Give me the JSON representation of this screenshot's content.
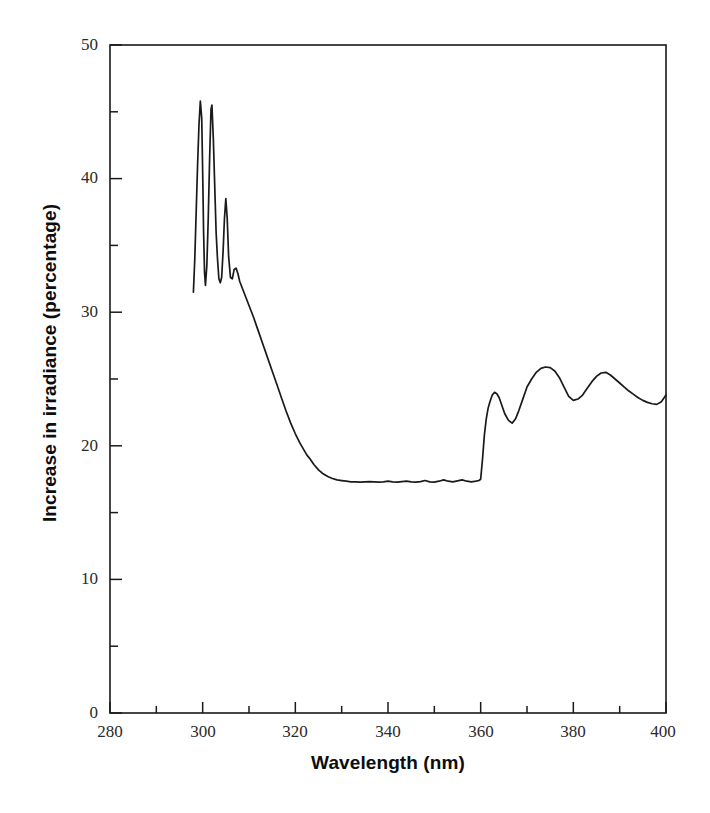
{
  "figure": {
    "background": "#ffffff",
    "line_color": "#1a1a1a",
    "axis_color": "#1a1a1a",
    "text_color": "#0d0d0d"
  },
  "axes": {
    "x_title": "Wavelength (nm)",
    "y_title": "Increase in irradiance (percentage)",
    "x_ticks": [
      "280",
      "300",
      "320",
      "340",
      "360",
      "380",
      "400"
    ],
    "y_ticks": [
      "0",
      "10",
      "20",
      "30",
      "40",
      "50"
    ]
  },
  "chart_data": {
    "type": "line",
    "title": "",
    "xlabel": "Wavelength (nm)",
    "ylabel": "Increase in irradiance (percentage)",
    "xlim": [
      280,
      400
    ],
    "ylim": [
      0,
      50
    ],
    "xticks": [
      280,
      300,
      320,
      340,
      360,
      380,
      400
    ],
    "yticks": [
      0,
      10,
      20,
      30,
      40,
      50
    ],
    "x_minor_tick_interval": 10,
    "y_minor_tick_interval": 5,
    "grid": false,
    "legend": false,
    "frame": "full-box",
    "series": [
      {
        "name": "Increase in irradiance",
        "x": [
          298.0,
          298.3,
          298.6,
          298.9,
          299.2,
          299.5,
          299.8,
          300.0,
          300.2,
          300.4,
          300.6,
          300.9,
          301.2,
          301.5,
          301.8,
          302.0,
          302.3,
          302.6,
          302.9,
          303.2,
          303.5,
          303.8,
          304.1,
          304.4,
          304.7,
          305.0,
          305.3,
          305.6,
          306.0,
          306.4,
          306.8,
          307.2,
          307.6,
          308.0,
          309.0,
          310.0,
          311.0,
          312.0,
          313.0,
          314.0,
          315.0,
          316.0,
          317.0,
          318.0,
          319.0,
          320.0,
          321.0,
          322.0,
          322.5,
          323.0,
          324.0,
          325.0,
          326.0,
          327.0,
          328.0,
          329.0,
          330.0,
          331.0,
          332.0,
          333.0,
          334.0,
          335.0,
          336.0,
          337.0,
          338.0,
          339.0,
          340.0,
          341.0,
          342.0,
          343.0,
          344.0,
          345.0,
          346.0,
          347.0,
          348.0,
          349.0,
          350.0,
          351.0,
          352.0,
          353.0,
          354.0,
          355.0,
          356.0,
          357.0,
          358.0,
          359.0,
          359.6,
          360.0,
          360.4,
          360.8,
          361.2,
          361.6,
          362.0,
          362.5,
          363.0,
          363.5,
          364.0,
          364.6,
          365.2,
          366.0,
          366.8,
          367.5,
          368.2,
          369.0,
          370.0,
          371.0,
          372.0,
          373.0,
          374.0,
          375.0,
          376.0,
          377.0,
          378.0,
          379.0,
          380.0,
          381.0,
          382.0,
          383.0,
          384.0,
          385.0,
          386.0,
          387.0,
          388.0,
          389.0,
          390.0,
          391.0,
          392.0,
          393.0,
          394.0,
          395.0,
          396.0,
          397.0,
          398.0,
          399.0,
          400.0
        ],
        "y": [
          31.5,
          34.0,
          37.5,
          41.0,
          44.0,
          45.8,
          44.5,
          40.5,
          36.0,
          33.0,
          32.0,
          33.5,
          37.0,
          41.5,
          45.2,
          45.5,
          43.0,
          39.5,
          36.0,
          34.0,
          32.5,
          32.2,
          32.6,
          34.5,
          37.0,
          38.5,
          37.0,
          34.2,
          32.6,
          32.5,
          33.2,
          33.3,
          32.9,
          32.3,
          31.4,
          30.5,
          29.6,
          28.6,
          27.6,
          26.6,
          25.6,
          24.6,
          23.6,
          22.6,
          21.7,
          20.9,
          20.2,
          19.6,
          19.3,
          19.1,
          18.6,
          18.2,
          17.9,
          17.7,
          17.55,
          17.45,
          17.4,
          17.35,
          17.3,
          17.3,
          17.28,
          17.3,
          17.32,
          17.3,
          17.28,
          17.3,
          17.35,
          17.3,
          17.28,
          17.32,
          17.35,
          17.3,
          17.28,
          17.32,
          17.4,
          17.3,
          17.28,
          17.35,
          17.45,
          17.35,
          17.3,
          17.38,
          17.45,
          17.35,
          17.3,
          17.35,
          17.4,
          17.5,
          19.0,
          20.8,
          22.0,
          22.8,
          23.3,
          23.8,
          24.0,
          23.9,
          23.6,
          23.0,
          22.4,
          21.9,
          21.7,
          22.0,
          22.6,
          23.4,
          24.4,
          25.0,
          25.5,
          25.8,
          25.9,
          25.85,
          25.6,
          25.1,
          24.4,
          23.7,
          23.4,
          23.5,
          23.8,
          24.3,
          24.8,
          25.2,
          25.45,
          25.5,
          25.3,
          25.0,
          24.7,
          24.4,
          24.1,
          23.85,
          23.6,
          23.4,
          23.25,
          23.15,
          23.1,
          23.3,
          23.8
        ]
      }
    ]
  }
}
